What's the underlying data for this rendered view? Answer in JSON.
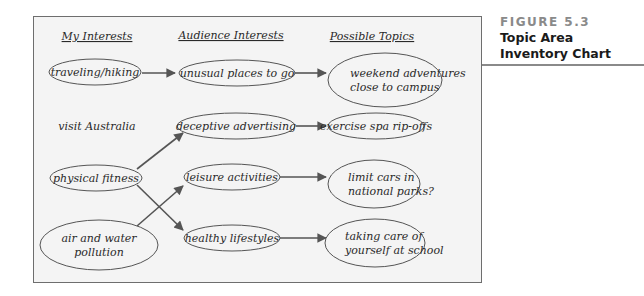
{
  "caption": {
    "figure_number": "FIGURE 5.3",
    "title_line1": "Topic Area",
    "title_line2": "Inventory Chart"
  },
  "columns": {
    "my_interests": "My Interests",
    "audience_interests": "Audience Interests",
    "possible_topics": "Possible Topics"
  },
  "nodes": {
    "my_interests": [
      {
        "id": "traveling",
        "lines": [
          "traveling/hiking"
        ],
        "ellipse": true
      },
      {
        "id": "australia",
        "lines": [
          "visit Australia"
        ],
        "ellipse": false
      },
      {
        "id": "fitness",
        "lines": [
          "physical fitness"
        ],
        "ellipse": true
      },
      {
        "id": "pollution",
        "lines": [
          "air and water",
          "pollution"
        ],
        "ellipse": true
      }
    ],
    "audience_interests": [
      {
        "id": "unusual",
        "lines": [
          "unusual places to go"
        ]
      },
      {
        "id": "deceptive",
        "lines": [
          "deceptive advertising"
        ]
      },
      {
        "id": "leisure",
        "lines": [
          "leisure activities"
        ]
      },
      {
        "id": "healthy",
        "lines": [
          "healthy lifestyles"
        ]
      }
    ],
    "possible_topics": [
      {
        "id": "weekend",
        "lines": [
          "weekend adventures",
          "close to campus"
        ]
      },
      {
        "id": "spa",
        "lines": [
          "exercise spa rip-offs"
        ]
      },
      {
        "id": "cars",
        "lines": [
          "limit cars in",
          "national parks?"
        ]
      },
      {
        "id": "care",
        "lines": [
          "taking care of",
          "yourself at school"
        ]
      }
    ]
  },
  "edges": [
    {
      "from": "traveling",
      "to": "unusual"
    },
    {
      "from": "unusual",
      "to": "weekend"
    },
    {
      "from": "fitness",
      "to": "deceptive"
    },
    {
      "from": "fitness",
      "to": "healthy"
    },
    {
      "from": "pollution",
      "to": "leisure"
    },
    {
      "from": "deceptive",
      "to": "spa"
    },
    {
      "from": "leisure",
      "to": "cars"
    },
    {
      "from": "healthy",
      "to": "care"
    }
  ],
  "colors": {
    "panel_bg": "#f4f4f4",
    "stroke": "#555555",
    "text": "#2a2a2a",
    "figure_label": "#8a8a8a"
  }
}
